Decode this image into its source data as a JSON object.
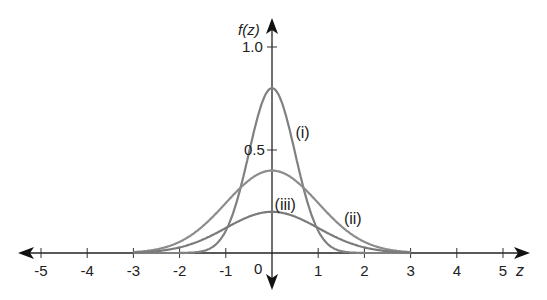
{
  "chart_data": {
    "type": "line",
    "title": "",
    "xlabel": "z",
    "ylabel": "f(z)",
    "xlim": [
      -5,
      5
    ],
    "ylim": [
      0,
      1.0
    ],
    "grid": false,
    "x_ticks": [
      "-5",
      "-4",
      "-3",
      "-2",
      "-1",
      "0",
      "1",
      "2",
      "3",
      "4",
      "5"
    ],
    "y_ticks": [
      "0.5",
      "1.0"
    ],
    "series": [
      {
        "name": "(i)",
        "description": "normal curve, mean 0, sd 0.5",
        "peak": 0.8,
        "support": [
          -3,
          3
        ],
        "color": "#808080"
      },
      {
        "name": "(ii)",
        "description": "normal curve, mean 0, sd 1",
        "peak": 0.4,
        "support": [
          -3,
          3
        ],
        "color": "#8c8c8c"
      },
      {
        "name": "(iii)",
        "description": "scaled normal curve, mean 0, sd 1",
        "peak": 0.2,
        "support": [
          -3,
          3
        ],
        "color": "#7a7a7a"
      }
    ],
    "annotations": [
      {
        "text": "(i)",
        "x": 0.55,
        "y": 0.58
      },
      {
        "text": "(ii)",
        "x": 1.6,
        "y": 0.16
      },
      {
        "text": "(iii)",
        "x": 0.1,
        "y": 0.23
      }
    ]
  },
  "axis": {
    "y_label": "f(z)",
    "x_label": "z",
    "y_tick_1": "1.0",
    "y_tick_05": "0.5",
    "origin": "0"
  }
}
